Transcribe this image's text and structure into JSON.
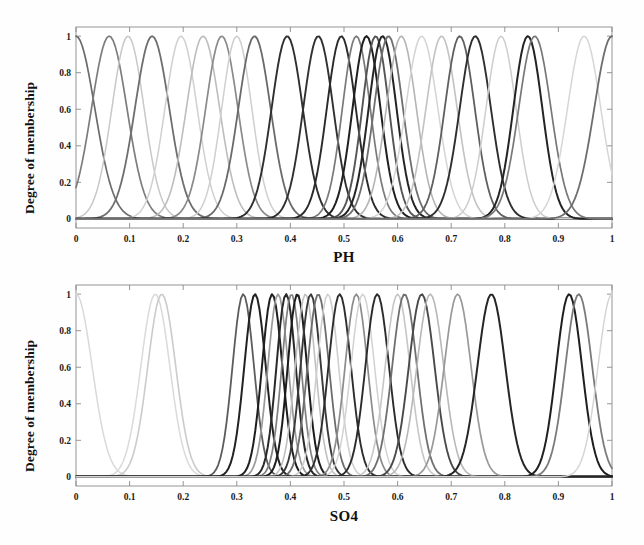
{
  "figure": {
    "background": "#fefefe",
    "width": 644,
    "height": 545
  },
  "panels": [
    {
      "id": "ph",
      "ylabel": "Degree of membership",
      "xlabel": "PH"
    },
    {
      "id": "so4",
      "ylabel": "Degree of membership",
      "xlabel": "SO4"
    }
  ],
  "chart_data": [
    {
      "type": "line",
      "title": "",
      "xlabel": "PH",
      "ylabel": "Degree of membership",
      "xlim": [
        0,
        1
      ],
      "ylim": [
        -0.05,
        1.05
      ],
      "xticks": [
        0,
        0.1,
        0.2,
        0.3,
        0.4,
        0.5,
        0.6,
        0.7,
        0.8,
        0.9,
        1
      ],
      "xticklabels": [
        "0",
        "0.1",
        "0.2",
        "0.3",
        "0.4",
        "0.5",
        "0.6",
        "0.7",
        "0.8",
        "0.9",
        "1"
      ],
      "yticks": [
        0,
        0.2,
        0.4,
        0.6,
        0.8,
        1
      ],
      "yticklabels": [
        "0",
        "0.2",
        "0.4",
        "0.6",
        "0.8",
        "1"
      ],
      "grid": false,
      "legend": "none",
      "curve_shape": "gaussian",
      "amplitude": 1.0,
      "series": [
        {
          "name": "mf1",
          "center": 0.0,
          "sigma": 0.035,
          "color": "#6b6b6b",
          "width": 1.7
        },
        {
          "name": "mf2",
          "center": 0.062,
          "sigma": 0.033,
          "color": "#7d7d7d",
          "width": 1.7
        },
        {
          "name": "mf3",
          "center": 0.097,
          "sigma": 0.03,
          "color": "#c8c8c8",
          "width": 1.5
        },
        {
          "name": "mf4",
          "center": 0.142,
          "sigma": 0.032,
          "color": "#6e6e6e",
          "width": 1.8
        },
        {
          "name": "mf5",
          "center": 0.196,
          "sigma": 0.03,
          "color": "#d0d0d0",
          "width": 1.5
        },
        {
          "name": "mf6",
          "center": 0.237,
          "sigma": 0.031,
          "color": "#bdbdbd",
          "width": 1.6
        },
        {
          "name": "mf7",
          "center": 0.272,
          "sigma": 0.03,
          "color": "#8a8a8a",
          "width": 1.7
        },
        {
          "name": "mf8",
          "center": 0.3,
          "sigma": 0.028,
          "color": "#cfcfcf",
          "width": 1.5
        },
        {
          "name": "mf9",
          "center": 0.333,
          "sigma": 0.03,
          "color": "#6a6a6a",
          "width": 1.8
        },
        {
          "name": "mf10",
          "center": 0.394,
          "sigma": 0.029,
          "color": "#2f2f2f",
          "width": 1.9
        },
        {
          "name": "mf11",
          "center": 0.452,
          "sigma": 0.028,
          "color": "#303030",
          "width": 1.9
        },
        {
          "name": "mf12",
          "center": 0.495,
          "sigma": 0.027,
          "color": "#2a2a2a",
          "width": 1.9
        },
        {
          "name": "mf13",
          "center": 0.523,
          "sigma": 0.026,
          "color": "#7a7a7a",
          "width": 1.7
        },
        {
          "name": "mf14",
          "center": 0.542,
          "sigma": 0.026,
          "color": "#1f1f1f",
          "width": 2.0
        },
        {
          "name": "mf15",
          "center": 0.559,
          "sigma": 0.025,
          "color": "#555555",
          "width": 1.9
        },
        {
          "name": "mf16",
          "center": 0.572,
          "sigma": 0.026,
          "color": "#242424",
          "width": 2.0
        },
        {
          "name": "mf17",
          "center": 0.583,
          "sigma": 0.027,
          "color": "#6f6f6f",
          "width": 1.8
        },
        {
          "name": "mf18",
          "center": 0.607,
          "sigma": 0.028,
          "color": "#b5b5b5",
          "width": 1.6
        },
        {
          "name": "mf19",
          "center": 0.645,
          "sigma": 0.03,
          "color": "#d4d4d4",
          "width": 1.5
        },
        {
          "name": "mf20",
          "center": 0.682,
          "sigma": 0.029,
          "color": "#c2c2c2",
          "width": 1.6
        },
        {
          "name": "mf21",
          "center": 0.716,
          "sigma": 0.028,
          "color": "#5f5f5f",
          "width": 1.8
        },
        {
          "name": "mf22",
          "center": 0.745,
          "sigma": 0.029,
          "color": "#2e2e2e",
          "width": 1.9
        },
        {
          "name": "mf23",
          "center": 0.793,
          "sigma": 0.028,
          "color": "#cdcdcd",
          "width": 1.5
        },
        {
          "name": "mf24",
          "center": 0.843,
          "sigma": 0.027,
          "color": "#242424",
          "width": 2.0
        },
        {
          "name": "mf25",
          "center": 0.856,
          "sigma": 0.03,
          "color": "#787878",
          "width": 1.7
        },
        {
          "name": "mf26",
          "center": 0.948,
          "sigma": 0.031,
          "color": "#d6d6d6",
          "width": 1.5
        },
        {
          "name": "mf27",
          "center": 1.0,
          "sigma": 0.033,
          "color": "#6d6d6d",
          "width": 1.8
        }
      ]
    },
    {
      "type": "line",
      "title": "",
      "xlabel": "SO4",
      "ylabel": "Degree of membership",
      "xlim": [
        0,
        1
      ],
      "ylim": [
        -0.05,
        1.05
      ],
      "xticks": [
        0,
        0.1,
        0.2,
        0.3,
        0.4,
        0.5,
        0.6,
        0.7,
        0.8,
        0.9,
        1
      ],
      "xticklabels": [
        "0",
        "0.1",
        "0.2",
        "0.3",
        "0.4",
        "0.5",
        "0.6",
        "0.7",
        "0.8",
        "0.9",
        "1"
      ],
      "yticks": [
        0,
        0.2,
        0.4,
        0.6,
        0.8,
        1
      ],
      "yticklabels": [
        "0",
        "0.2",
        "0.4",
        "0.6",
        "0.8",
        "1"
      ],
      "grid": false,
      "legend": "none",
      "curve_shape": "gaussian",
      "amplitude": 1.0,
      "series": [
        {
          "name": "mf1",
          "center": 0.0,
          "sigma": 0.03,
          "color": "#d9d9d9",
          "width": 1.5
        },
        {
          "name": "mf2",
          "center": 0.148,
          "sigma": 0.027,
          "color": "#dadada",
          "width": 1.5
        },
        {
          "name": "mf3",
          "center": 0.16,
          "sigma": 0.026,
          "color": "#cbcbcb",
          "width": 1.6
        },
        {
          "name": "mf4",
          "center": 0.312,
          "sigma": 0.02,
          "color": "#5c5c5c",
          "width": 1.8
        },
        {
          "name": "mf5",
          "center": 0.334,
          "sigma": 0.02,
          "color": "#222222",
          "width": 2.0
        },
        {
          "name": "mf6",
          "center": 0.366,
          "sigma": 0.019,
          "color": "#1e1e1e",
          "width": 2.0
        },
        {
          "name": "mf7",
          "center": 0.377,
          "sigma": 0.019,
          "color": "#9a9a9a",
          "width": 1.7
        },
        {
          "name": "mf8",
          "center": 0.392,
          "sigma": 0.018,
          "color": "#2a2a2a",
          "width": 2.0
        },
        {
          "name": "mf9",
          "center": 0.402,
          "sigma": 0.018,
          "color": "#808080",
          "width": 1.7
        },
        {
          "name": "mf10",
          "center": 0.413,
          "sigma": 0.018,
          "color": "#1c1c1c",
          "width": 2.0
        },
        {
          "name": "mf11",
          "center": 0.428,
          "sigma": 0.019,
          "color": "#c0c0c0",
          "width": 1.6
        },
        {
          "name": "mf12",
          "center": 0.438,
          "sigma": 0.019,
          "color": "#3a3a3a",
          "width": 1.9
        },
        {
          "name": "mf13",
          "center": 0.452,
          "sigma": 0.02,
          "color": "#6d6d6d",
          "width": 1.8
        },
        {
          "name": "mf14",
          "center": 0.47,
          "sigma": 0.02,
          "color": "#cfcfcf",
          "width": 1.6
        },
        {
          "name": "mf15",
          "center": 0.492,
          "sigma": 0.021,
          "color": "#2e2e2e",
          "width": 1.9
        },
        {
          "name": "mf16",
          "center": 0.523,
          "sigma": 0.021,
          "color": "#8c8c8c",
          "width": 1.7
        },
        {
          "name": "mf17",
          "center": 0.535,
          "sigma": 0.022,
          "color": "#d2d2d2",
          "width": 1.5
        },
        {
          "name": "mf18",
          "center": 0.562,
          "sigma": 0.022,
          "color": "#2b2b2b",
          "width": 1.9
        },
        {
          "name": "mf19",
          "center": 0.6,
          "sigma": 0.023,
          "color": "#c6c6c6",
          "width": 1.6
        },
        {
          "name": "mf20",
          "center": 0.613,
          "sigma": 0.023,
          "color": "#707070",
          "width": 1.8
        },
        {
          "name": "mf21",
          "center": 0.645,
          "sigma": 0.024,
          "color": "#4a4a4a",
          "width": 1.9
        },
        {
          "name": "mf22",
          "center": 0.661,
          "sigma": 0.025,
          "color": "#b8b8b8",
          "width": 1.6
        },
        {
          "name": "mf23",
          "center": 0.712,
          "sigma": 0.025,
          "color": "#999999",
          "width": 1.7
        },
        {
          "name": "mf24",
          "center": 0.775,
          "sigma": 0.026,
          "color": "#262626",
          "width": 2.0
        },
        {
          "name": "mf25",
          "center": 0.92,
          "sigma": 0.024,
          "color": "#1f1f1f",
          "width": 2.0
        },
        {
          "name": "mf26",
          "center": 0.938,
          "sigma": 0.025,
          "color": "#7b7b7b",
          "width": 1.8
        },
        {
          "name": "mf27",
          "center": 1.0,
          "sigma": 0.026,
          "color": "#d5d5d5",
          "width": 1.5
        }
      ]
    }
  ],
  "axes_style": {
    "axis_color": "#8a8a8a",
    "tick_color": "#8a8a8a",
    "text_color": "#111111",
    "box": true
  }
}
